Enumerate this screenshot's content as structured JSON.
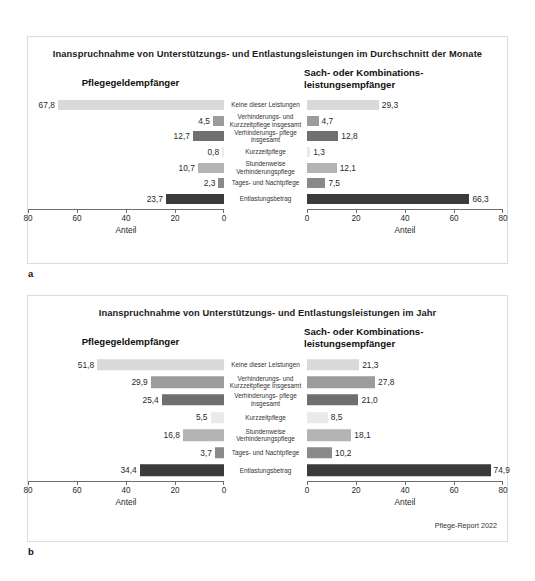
{
  "document": {
    "source_note": "Pflege-Report 2022"
  },
  "panels": [
    {
      "letter": "a",
      "title": "Inanspruchnahme von Unterstützungs- und Entlastungsleistungen im Durchschnitt der Monate",
      "left_heading": "Pflegegeldempfänger",
      "right_heading": "Sach- oder Kombinations-\nleistungsempfänger",
      "axis_label_left": "Anteil",
      "axis_label_right": "Anteil"
    },
    {
      "letter": "b",
      "title": "Inanspruchnahme von Unterstützungs- und Entlastungsleistungen im Jahr",
      "left_heading": "Pflegegeldempfänger",
      "right_heading": "Sach- oder Kombinations-\nleistungsempfänger",
      "axis_label_left": "Anteil",
      "axis_label_right": "Anteil"
    }
  ],
  "chart_data": [
    {
      "type": "bar",
      "title": "Inanspruchnahme von Unterstützungs- und Entlastungsleistungen im Durchschnitt der Monate",
      "panel": "a",
      "orientation": "horizontal-diverging",
      "categories": [
        "Keine dieser Leistungen",
        "Verhinderungs- und Kurzzeitpflege insgesamt",
        "Verhinderungs- pflege insgesamt",
        "Kurzzeitpflege",
        "Stundenweise Verhinderungspflege",
        "Tages- und Nachtpflege",
        "Entlastungsbetrag"
      ],
      "series": [
        {
          "name": "Pflegegeldempfänger",
          "side": "left",
          "values": [
            67.8,
            4.5,
            12.7,
            0.8,
            10.7,
            2.3,
            23.7
          ],
          "labels": [
            "67,8",
            "4,5",
            "12,7",
            "0,8",
            "10,7",
            "2,3",
            "23,7"
          ]
        },
        {
          "name": "Sach- oder Kombinationsleistungsempfänger",
          "side": "right",
          "values": [
            29.3,
            4.7,
            12.8,
            1.3,
            12.1,
            7.5,
            66.3
          ],
          "labels": [
            "29,3",
            "4,7",
            "12,8",
            "1,3",
            "12,1",
            "7,5",
            "66,3"
          ]
        }
      ],
      "xlabel": "Anteil",
      "ylabel": "",
      "xlim": [
        0,
        80
      ],
      "ticks_left": [
        "80",
        "60",
        "40",
        "20",
        "0"
      ],
      "ticks_right": [
        "0",
        "20",
        "40",
        "60",
        "80"
      ],
      "grid": false,
      "legend": "none",
      "bar_colors": [
        "#d9d9d9",
        "#9c9c9c",
        "#6f6f6f",
        "#eaeaea",
        "#b4b4b4",
        "#8a8a8a",
        "#3b3b3b"
      ]
    },
    {
      "type": "bar",
      "title": "Inanspruchnahme von Unterstützungs- und Entlastungsleistungen im Jahr",
      "panel": "b",
      "orientation": "horizontal-diverging",
      "categories": [
        "Keine dieser Leistungen",
        "Verhinderungs- und Kurzzeitpflege insgesamt",
        "Verhinderungs- pflege insgesamt",
        "Kurzzeitpflege",
        "Stundenweise Verhinderungspflege",
        "Tages- und Nachtpflege",
        "Entlastungsbetrag"
      ],
      "series": [
        {
          "name": "Pflegegeldempfänger",
          "side": "left",
          "values": [
            51.8,
            29.9,
            25.4,
            5.5,
            16.8,
            3.7,
            34.4
          ],
          "labels": [
            "51,8",
            "29,9",
            "25,4",
            "5,5",
            "16,8",
            "3,7",
            "34,4"
          ]
        },
        {
          "name": "Sach- oder Kombinationsleistungsempfänger",
          "side": "right",
          "values": [
            21.3,
            27.8,
            21.0,
            8.5,
            18.1,
            10.2,
            74.9
          ],
          "labels": [
            "21,3",
            "27,8",
            "21,0",
            "8,5",
            "18,1",
            "10,2",
            "74,9"
          ]
        }
      ],
      "xlabel": "Anteil",
      "ylabel": "",
      "xlim": [
        0,
        80
      ],
      "ticks_left": [
        "80",
        "60",
        "40",
        "20",
        "0"
      ],
      "ticks_right": [
        "0",
        "20",
        "40",
        "60",
        "80"
      ],
      "grid": false,
      "legend": "none",
      "bar_colors": [
        "#d9d9d9",
        "#9c9c9c",
        "#6f6f6f",
        "#eaeaea",
        "#b4b4b4",
        "#8a8a8a",
        "#3b3b3b"
      ]
    }
  ]
}
